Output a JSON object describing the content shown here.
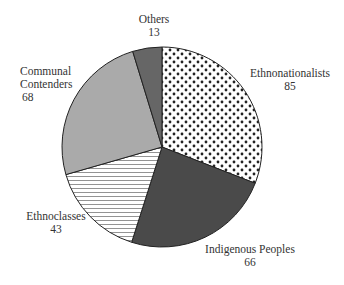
{
  "chart_data": {
    "type": "pie",
    "title": "",
    "start_angle": "12 o'clock, clockwise",
    "categories": [
      "Ethnonationalists",
      "Indigenous Peoples",
      "Ethnoclasses",
      "Communal Contenders",
      "Others"
    ],
    "values": [
      85,
      66,
      43,
      68,
      13
    ],
    "fills": [
      "dotted-pattern",
      "#4a4a4a",
      "horizontal-lines-pattern",
      "#aaaaaa",
      "#666666"
    ],
    "legend": "none (direct labels)"
  },
  "labels": {
    "ethnonationalists": {
      "name": "Ethnonationalists",
      "value": "85"
    },
    "indigenous": {
      "name": "Indigenous Peoples",
      "value": "66"
    },
    "ethnoclasses": {
      "name": "Ethnoclasses",
      "value": "43"
    },
    "communal": {
      "name1": "Communal",
      "name2": "Contenders",
      "value": "68"
    },
    "others": {
      "name": "Others",
      "value": "13"
    }
  }
}
